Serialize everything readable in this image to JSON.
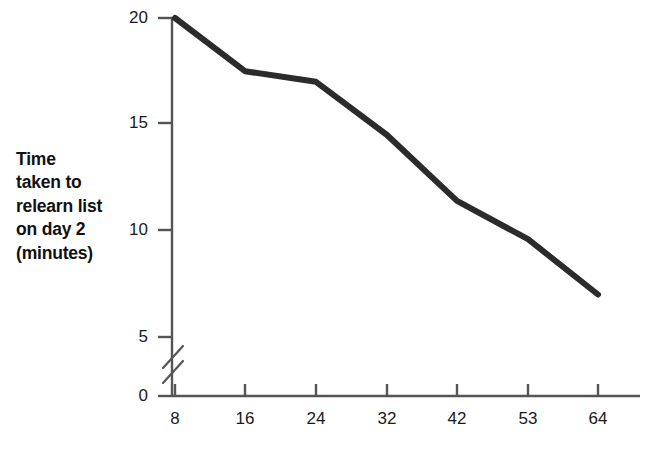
{
  "chart_data": {
    "type": "line",
    "title": "",
    "subtitle": "",
    "xlabel": "Number of repetitions of list on day 1",
    "ylabel": "Time taken to relearn list on day 2 (minutes)",
    "ylabel_lines": [
      "Time",
      "taken to",
      "relearn list",
      "on day 2",
      "(minutes)"
    ],
    "x": [
      8,
      16,
      24,
      32,
      42,
      53,
      64
    ],
    "xtick_labels": [
      "8",
      "16",
      "24",
      "32",
      "42",
      "53",
      "64"
    ],
    "values": [
      20.0,
      17.5,
      17.0,
      14.5,
      11.4,
      9.6,
      7.0
    ],
    "ytick_labels": [
      "0",
      "5",
      "10",
      "15",
      "20"
    ],
    "yticks": [
      0,
      5,
      10,
      15,
      20
    ],
    "ylim": [
      0,
      20
    ],
    "xlim_categorical": true,
    "axis_break": {
      "present": true,
      "between": [
        0,
        5
      ],
      "style": "double-slash"
    },
    "grid": false,
    "legend": null,
    "series": [
      {
        "name": "Time to relearn",
        "values": [
          20.0,
          17.5,
          17.0,
          14.5,
          11.4,
          9.6,
          7.0
        ]
      }
    ],
    "colors": {
      "line": "#2b2b2b",
      "axis": "#555555",
      "text": "#111111",
      "background": "#ffffff"
    },
    "line_width_px": 6
  }
}
